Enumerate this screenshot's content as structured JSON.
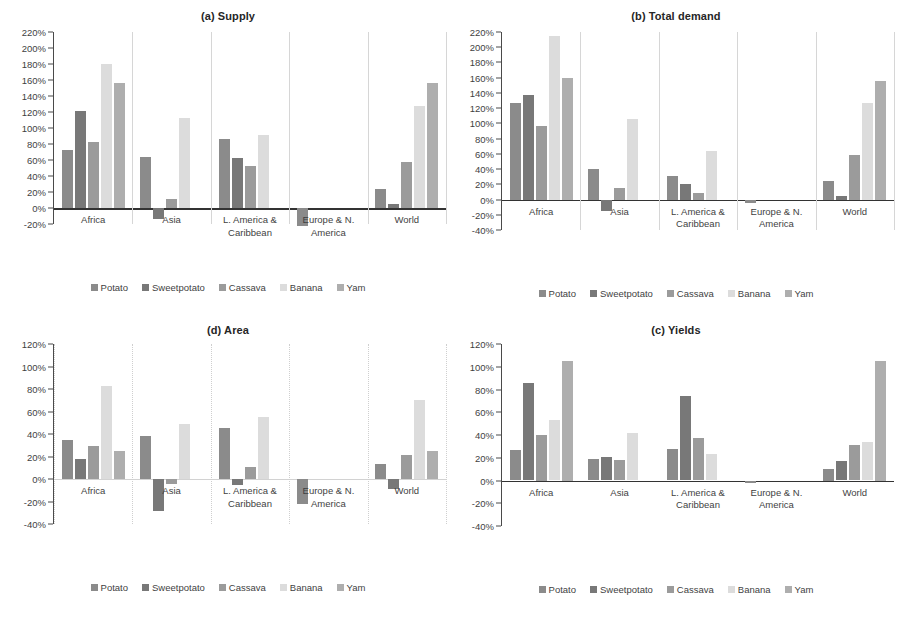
{
  "figure": {
    "series": [
      {
        "name": "Potato",
        "color": "#8b8b8b"
      },
      {
        "name": "Sweetpotato",
        "color": "#787878"
      },
      {
        "name": "Cassava",
        "color": "#9b9b9b"
      },
      {
        "name": "Banana",
        "color": "#dcdcdc"
      },
      {
        "name": "Yam",
        "color": "#aeaeae"
      }
    ]
  },
  "chart_data": [
    {
      "id": "supply",
      "type": "bar",
      "title": "(a) Supply",
      "xlabel": "",
      "ylabel": "",
      "ylim": [
        -20,
        220
      ],
      "ytick_step": 20,
      "ticklabels": [
        "220%",
        "200%",
        "180%",
        "160%",
        "140%",
        "120%",
        "100%",
        "80%",
        "60%",
        "40%",
        "20%",
        "0%",
        "-20%"
      ],
      "grid": false,
      "dividers": "solid",
      "legend_position": "bottom",
      "categories": [
        "Africa",
        "Asia",
        "L. America & Caribbean",
        "Europe & N. America",
        "World"
      ],
      "series": [
        {
          "name": "Potato",
          "values": [
            72,
            64,
            86,
            -22,
            24
          ]
        },
        {
          "name": "Sweetpotato",
          "values": [
            121,
            -14,
            63,
            0,
            5
          ]
        },
        {
          "name": "Cassava",
          "values": [
            82,
            11,
            53,
            0,
            58
          ]
        },
        {
          "name": "Banana",
          "values": [
            180,
            113,
            91,
            0,
            128
          ]
        },
        {
          "name": "Yam",
          "values": [
            156,
            0,
            0,
            0,
            156
          ]
        }
      ]
    },
    {
      "id": "total-demand",
      "type": "bar",
      "title": "(b) Total demand",
      "xlabel": "",
      "ylabel": "",
      "ylim": [
        -40,
        220
      ],
      "ytick_step": 20,
      "ticklabels": [
        "220%",
        "200%",
        "180%",
        "160%",
        "140%",
        "120%",
        "100%",
        "80%",
        "60%",
        "40%",
        "20%",
        "0%",
        "-20%",
        "-40%"
      ],
      "grid": false,
      "dividers": "solid",
      "legend_position": "bottom",
      "categories": [
        "Africa",
        "Asia",
        "L. America & Caribbean",
        "Europe & N. America",
        "World"
      ],
      "series": [
        {
          "name": "Potato",
          "values": [
            127,
            40,
            31,
            -5,
            24
          ]
        },
        {
          "name": "Sweetpotato",
          "values": [
            137,
            -15,
            21,
            0,
            4
          ]
        },
        {
          "name": "Cassava",
          "values": [
            96,
            15,
            8,
            0,
            58
          ]
        },
        {
          "name": "Banana",
          "values": [
            215,
            106,
            64,
            0,
            127
          ]
        },
        {
          "name": "Yam",
          "values": [
            159,
            0,
            0,
            0,
            156
          ]
        }
      ]
    },
    {
      "id": "area",
      "type": "bar",
      "title": "(d) Area",
      "xlabel": "",
      "ylabel": "",
      "ylim": [
        -40,
        120
      ],
      "ytick_step": 20,
      "ticklabels": [
        "120%",
        "100%",
        "80%",
        "60%",
        "40%",
        "20%",
        "0%",
        "-20%",
        "-40%"
      ],
      "grid": false,
      "dividers": "dotted",
      "legend_position": "bottom",
      "categories": [
        "Africa",
        "Asia",
        "L. America & Caribbean",
        "Europe & N. America",
        "World"
      ],
      "series": [
        {
          "name": "Potato",
          "values": [
            35,
            38,
            45,
            -22,
            13
          ]
        },
        {
          "name": "Sweetpotato",
          "values": [
            18,
            -28,
            -5,
            0,
            -9
          ]
        },
        {
          "name": "Cassava",
          "values": [
            29,
            -4,
            11,
            0,
            21
          ]
        },
        {
          "name": "Banana",
          "values": [
            83,
            49,
            55,
            0,
            70
          ]
        },
        {
          "name": "Yam",
          "values": [
            25,
            0,
            0,
            0,
            25
          ]
        }
      ]
    },
    {
      "id": "yields",
      "type": "bar",
      "title": "(c) Yields",
      "xlabel": "",
      "ylabel": "",
      "ylim": [
        -40,
        120
      ],
      "ytick_step": 20,
      "ticklabels": [
        "120%",
        "100%",
        "80%",
        "60%",
        "40%",
        "20%",
        "0%",
        "-20%",
        "-40%"
      ],
      "grid": false,
      "dividers": "none",
      "legend_position": "bottom",
      "categories": [
        "Africa",
        "Asia",
        "L. America & Caribbean",
        "Europe & N. America",
        "World"
      ],
      "series": [
        {
          "name": "Potato",
          "values": [
            27,
            19,
            28,
            -2,
            10
          ]
        },
        {
          "name": "Sweetpotato",
          "values": [
            86,
            21,
            74,
            0,
            17
          ]
        },
        {
          "name": "Cassava",
          "values": [
            40,
            18,
            37,
            0,
            31
          ]
        },
        {
          "name": "Banana",
          "values": [
            53,
            42,
            23,
            0,
            34
          ]
        },
        {
          "name": "Yam",
          "values": [
            105,
            0,
            0,
            0,
            105
          ]
        }
      ]
    }
  ]
}
